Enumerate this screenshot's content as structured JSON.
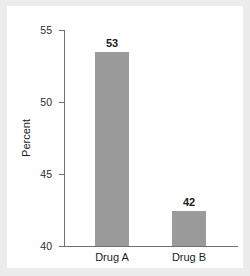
{
  "chart_data": {
    "type": "bar",
    "title": "",
    "subtitle": "",
    "xlabel": "",
    "ylabel": "Percent",
    "categories": [
      "Drug A",
      "Drug B"
    ],
    "values": [
      53.5,
      42.4
    ],
    "data_labels": [
      "53",
      "42"
    ],
    "ylim": [
      40,
      55
    ],
    "yticks": [
      "55",
      "50",
      "45",
      "40"
    ],
    "ytick_values": [
      55,
      50,
      45,
      40
    ],
    "grid": false,
    "legend": false,
    "bar_color": "#9a9a9a",
    "axis_color": "#6f6f6f",
    "text_color": "#1c1c1c",
    "panel_color": "#ffffff",
    "background_color": "#ececed"
  },
  "figure": {
    "ylabel": "Percent",
    "ytick_0": "55",
    "ytick_1": "50",
    "ytick_2": "45",
    "ytick_3": "40",
    "xtick_0": "Drug A",
    "xtick_1": "Drug B",
    "value_0": "53",
    "value_1": "42"
  }
}
